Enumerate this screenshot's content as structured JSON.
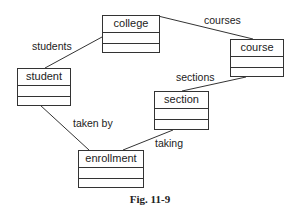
{
  "diagram": {
    "type": "uml-class-diagram",
    "classes": [
      {
        "id": "college",
        "name": "college"
      },
      {
        "id": "course",
        "name": "course"
      },
      {
        "id": "student",
        "name": "student"
      },
      {
        "id": "section",
        "name": "section"
      },
      {
        "id": "enrollment",
        "name": "enrollment"
      }
    ],
    "associations": [
      {
        "from": "college",
        "to": "student",
        "label": "students"
      },
      {
        "from": "college",
        "to": "course",
        "label": "courses"
      },
      {
        "from": "course",
        "to": "section",
        "label": "sections"
      },
      {
        "from": "student",
        "to": "enrollment",
        "label": "taken by"
      },
      {
        "from": "section",
        "to": "enrollment",
        "label": "taking"
      }
    ],
    "caption": "Fig. 11-9"
  }
}
